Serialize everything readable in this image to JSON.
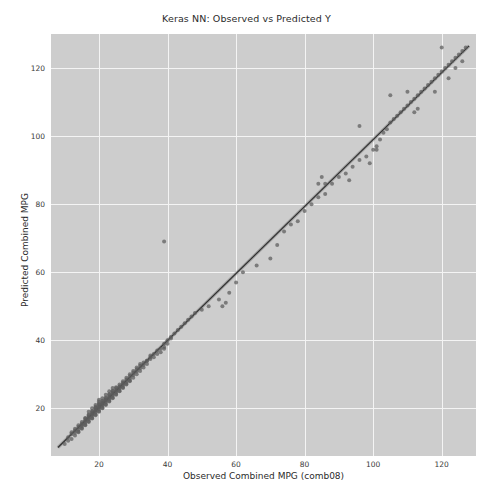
{
  "figure": {
    "width": 493,
    "height": 501,
    "background_color": "#ffffff",
    "plot_background_color": "#cdcdcd",
    "grid_color": "#f4f4f4"
  },
  "chart_data": {
    "type": "scatter",
    "title": "Keras NN: Observed vs Predicted Y",
    "xlabel": "Observed Combined MPG (comb08)",
    "ylabel": "Predicted Combined MPG",
    "xlim": [
      6,
      130
    ],
    "ylim": [
      6,
      130
    ],
    "xticks": [
      20,
      40,
      60,
      80,
      100,
      120
    ],
    "yticks": [
      20,
      40,
      60,
      80,
      100,
      120
    ],
    "xtick_labels": [
      "20",
      "40",
      "60",
      "80",
      "100",
      "120"
    ],
    "ytick_labels": [
      "20",
      "40",
      "60",
      "80",
      "100",
      "120"
    ],
    "grid": true,
    "legend": null,
    "marker_color": "#5c5c5c",
    "marker_opacity": 0.72,
    "marker_size": 4,
    "fit_line": {
      "label": "identity / regression fit",
      "color": "#2e2e2e",
      "x": [
        8,
        128
      ],
      "y": [
        8.5,
        126.5
      ]
    },
    "series": [
      {
        "name": "Observed vs Predicted",
        "x": [
          10,
          11,
          11,
          12,
          12,
          12,
          13,
          13,
          13,
          13,
          14,
          14,
          14,
          14,
          14,
          15,
          15,
          15,
          15,
          15,
          15,
          16,
          16,
          16,
          16,
          16,
          16,
          16,
          17,
          17,
          17,
          17,
          17,
          17,
          17,
          17,
          18,
          18,
          18,
          18,
          18,
          18,
          18,
          18,
          18,
          19,
          19,
          19,
          19,
          19,
          19,
          19,
          19,
          19,
          19,
          20,
          20,
          20,
          20,
          20,
          20,
          20,
          20,
          20,
          20,
          20,
          21,
          21,
          21,
          21,
          21,
          21,
          21,
          21,
          21,
          22,
          22,
          22,
          22,
          22,
          22,
          22,
          22,
          22,
          23,
          23,
          23,
          23,
          23,
          23,
          23,
          23,
          24,
          24,
          24,
          24,
          24,
          24,
          24,
          24,
          25,
          25,
          25,
          25,
          25,
          25,
          25,
          26,
          26,
          26,
          26,
          26,
          26,
          27,
          27,
          27,
          27,
          27,
          27,
          28,
          28,
          28,
          28,
          28,
          29,
          29,
          29,
          29,
          29,
          30,
          30,
          30,
          30,
          31,
          31,
          31,
          31,
          32,
          32,
          32,
          32,
          33,
          33,
          33,
          34,
          34,
          34,
          35,
          35,
          35,
          36,
          36,
          37,
          37,
          38,
          38,
          39,
          39,
          39,
          40,
          40,
          41,
          41,
          42,
          43,
          44,
          45,
          46,
          47,
          48,
          50,
          52,
          55,
          58,
          60,
          62,
          66,
          70,
          72,
          74,
          76,
          78,
          80,
          82,
          84,
          86,
          88,
          90,
          92,
          94,
          96,
          98,
          100,
          101,
          102,
          103,
          104,
          105,
          106,
          107,
          108,
          109,
          110,
          111,
          112,
          113,
          114,
          115,
          116,
          117,
          118,
          119,
          120,
          121,
          122,
          123,
          124,
          125,
          126,
          127,
          39,
          84,
          85,
          86,
          56,
          57,
          101,
          113,
          105,
          110,
          112,
          118,
          120,
          122,
          124,
          126,
          99,
          96,
          93
        ],
        "y": [
          9.5,
          10.5,
          11.5,
          11,
          12.5,
          13,
          12,
          12.8,
          13.5,
          14,
          13,
          13.8,
          14.5,
          15,
          13.2,
          14,
          14.8,
          15.5,
          16,
          14.2,
          15.2,
          15,
          15.8,
          16.5,
          17,
          15.2,
          16.2,
          17.2,
          16,
          16.8,
          17.5,
          18,
          16.2,
          17.2,
          18.2,
          19,
          17,
          17.8,
          18.5,
          19,
          17.2,
          18.2,
          19.2,
          20,
          18.5,
          18,
          18.8,
          19.5,
          20,
          18.2,
          19.2,
          20.2,
          21,
          19.5,
          20.5,
          19,
          19.8,
          20.5,
          21,
          19.2,
          20.2,
          21.2,
          22,
          20.5,
          21.5,
          22.5,
          20,
          20.8,
          21.5,
          22,
          20.2,
          21.2,
          22.2,
          23,
          21.5,
          21,
          21.8,
          22.5,
          23,
          21.2,
          22.2,
          23.2,
          24,
          22.5,
          22,
          22.8,
          23.5,
          24,
          22.2,
          23.2,
          24.2,
          25,
          23,
          23.8,
          24.5,
          25,
          23.2,
          24.2,
          25.2,
          26,
          24,
          24.8,
          25.5,
          26,
          24.2,
          25.2,
          26.2,
          25,
          25.8,
          26.5,
          27,
          25.2,
          26.2,
          26,
          26.8,
          27.5,
          28,
          26.2,
          27.2,
          27,
          27.8,
          28.5,
          29,
          27.2,
          28,
          28.8,
          29.5,
          30,
          28.2,
          29,
          29.8,
          30.5,
          31,
          30,
          30.8,
          31.5,
          32,
          31,
          31.8,
          32.5,
          33,
          32,
          32.8,
          33.5,
          34,
          33,
          34,
          35,
          34.5,
          35.5,
          36,
          35,
          36,
          37,
          36.5,
          37.5,
          38,
          39,
          37.5,
          39,
          40,
          40.5,
          41,
          42,
          43,
          44,
          45,
          46,
          47,
          48,
          49,
          50,
          52,
          54,
          57,
          60,
          62,
          64,
          68,
          72,
          74,
          75,
          78,
          80,
          82,
          83,
          86,
          88,
          89,
          91,
          93,
          94,
          96,
          97,
          99,
          101,
          102,
          104,
          105,
          106,
          107,
          108,
          109,
          110,
          111,
          112,
          113,
          114,
          115,
          116,
          117,
          118,
          119,
          120,
          121,
          122,
          123,
          124,
          125,
          126,
          69,
          86,
          88,
          86,
          50,
          51,
          96,
          108,
          112,
          113,
          107,
          113,
          126,
          117,
          120,
          122,
          92,
          103,
          87
        ]
      }
    ]
  },
  "axes": {
    "title": "Keras NN: Observed vs Predicted Y",
    "x_axis_label": "Observed Combined MPG (comb08)",
    "y_axis_label": "Predicted Combined MPG"
  }
}
